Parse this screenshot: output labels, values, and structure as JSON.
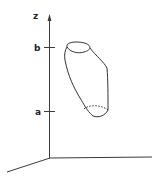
{
  "diagram": {
    "axes": {
      "z_label": "z",
      "ticks": [
        {
          "label": "b"
        },
        {
          "label": "a"
        }
      ]
    },
    "solid": {
      "description": "solid region between z = a and z = b"
    },
    "colors": {
      "stroke": "#333333",
      "background": "#ffffff"
    }
  }
}
